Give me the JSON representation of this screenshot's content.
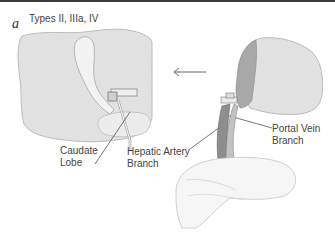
{
  "figure": {
    "panel_letter": "a",
    "panel_title": "Types II, IIIa, IV",
    "labels": {
      "caudate_lobe": [
        "Caudate",
        "Lobe"
      ],
      "hepatic_artery": [
        "Hepatic Artery",
        "Branch"
      ],
      "portal_vein": [
        "Portal Vein",
        "Branch"
      ]
    },
    "arrow_direction": "left",
    "colors": {
      "liver_fill": "#e2e2e2",
      "liver_outline": "#b8b8b8",
      "shade": "#9a9a9a",
      "text": "#444444",
      "rule": "#3a3a3a"
    }
  }
}
